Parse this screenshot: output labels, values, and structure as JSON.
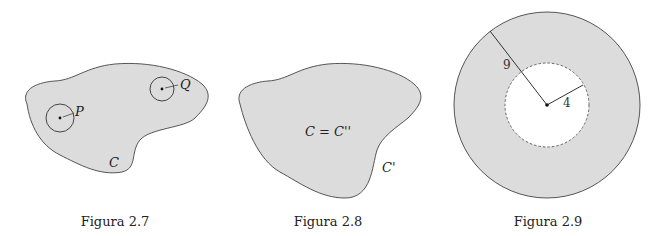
{
  "colors": {
    "region_fill": "#dcdcdc",
    "outline": "#555555",
    "background": "#ffffff"
  },
  "figures": [
    {
      "id": "fig-2-7",
      "caption": "Figura 2.7",
      "region_label": "C",
      "points": [
        {
          "label": "P",
          "type": "interior point with neighborhood"
        },
        {
          "label": "Q",
          "type": "boundary point with neighborhood"
        }
      ]
    },
    {
      "id": "fig-2-8",
      "caption": "Figura 2.8",
      "region_label": "C = C''",
      "boundary_label": "C'"
    },
    {
      "id": "fig-2-9",
      "caption": "Figura 2.9",
      "outer_radius_label": "9",
      "inner_radius_label": "4"
    }
  ]
}
